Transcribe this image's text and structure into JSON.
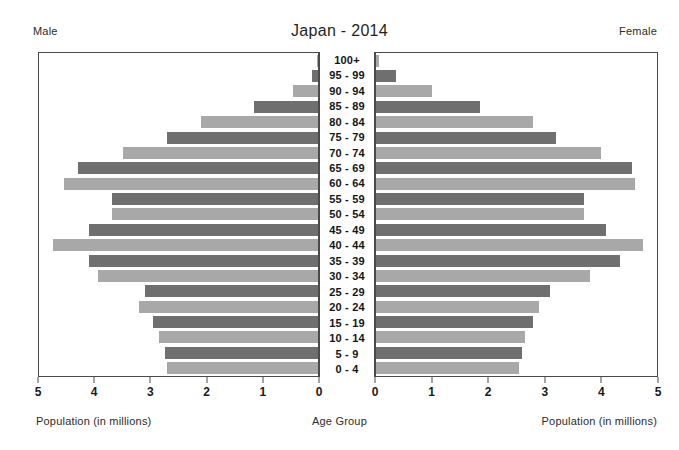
{
  "header": {
    "title": "Japan - 2014",
    "left_label": "Male",
    "right_label": "Female"
  },
  "footer": {
    "left_axis_label": "Population (in millions)",
    "center_axis_label": "Age Group",
    "right_axis_label": "Population (in millions)"
  },
  "axes": {
    "left_ticks": [
      "5",
      "4",
      "3",
      "2",
      "1",
      "0"
    ],
    "right_ticks": [
      "0",
      "1",
      "2",
      "3",
      "4",
      "5"
    ]
  },
  "colors": {
    "bar_light": "#a8a8a8",
    "bar_dark": "#6f6f6f",
    "axis": "#4a4a4a",
    "text": "#1a1a1a",
    "background": "#ffffff"
  },
  "chart_data": {
    "type": "bar",
    "subtype": "population-pyramid",
    "title": "Japan - 2014",
    "xlabel": "Population (in millions)",
    "ylabel": "Age Group",
    "xlim": [
      0,
      5
    ],
    "grid": false,
    "legend": "none",
    "categories": [
      "100+",
      "95 - 99",
      "90 - 94",
      "85 - 89",
      "80 - 84",
      "75 - 79",
      "70 - 74",
      "65 - 69",
      "60 - 64",
      "55 - 59",
      "50 - 54",
      "45 - 49",
      "40 - 44",
      "35 - 39",
      "30 - 34",
      "25 - 29",
      "20 - 24",
      "15 - 19",
      "10 - 14",
      "5 - 9",
      "0 - 4"
    ],
    "series": [
      {
        "name": "Male",
        "side": "left",
        "values": [
          0.01,
          0.1,
          0.45,
          1.15,
          2.1,
          2.7,
          3.5,
          4.3,
          4.55,
          3.7,
          3.7,
          4.1,
          4.75,
          4.1,
          3.95,
          3.1,
          3.2,
          2.95,
          2.85,
          2.75,
          2.7
        ]
      },
      {
        "name": "Female",
        "side": "right",
        "values": [
          0.06,
          0.35,
          1.0,
          1.85,
          2.8,
          3.2,
          4.0,
          4.55,
          4.6,
          3.7,
          3.7,
          4.1,
          4.75,
          4.35,
          3.8,
          3.1,
          2.9,
          2.8,
          2.65,
          2.6,
          2.55
        ]
      }
    ],
    "bar_shades": [
      "light",
      "dark",
      "light",
      "dark",
      "light",
      "dark",
      "light",
      "dark",
      "light",
      "dark",
      "light",
      "dark",
      "light",
      "dark",
      "light",
      "dark",
      "light",
      "dark",
      "light",
      "dark",
      "light"
    ]
  }
}
